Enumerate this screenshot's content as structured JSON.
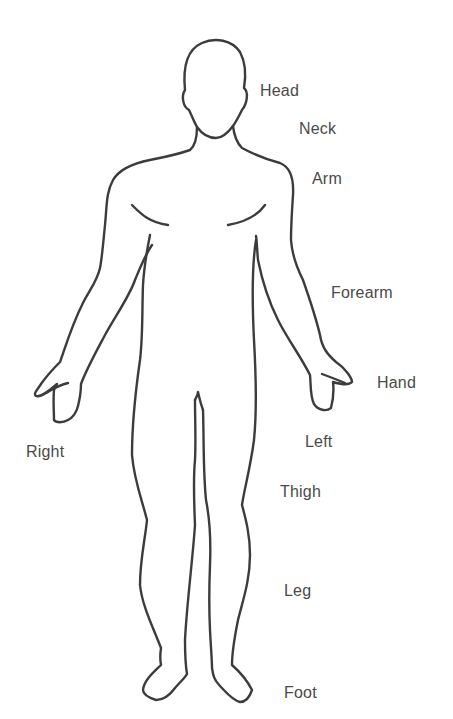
{
  "diagram": {
    "type": "anatomical-body-outline",
    "view": "anterior",
    "line_color": "#3c3c3c",
    "label_color": "#4a4a4a",
    "background": "#ffffff"
  },
  "labels": {
    "head": "Head",
    "neck": "Neck",
    "arm": "Arm",
    "forearm": "Forearm",
    "hand": "Hand",
    "right": "Right",
    "left": "Left",
    "thigh": "Thigh",
    "leg": "Leg",
    "foot": "Foot"
  }
}
